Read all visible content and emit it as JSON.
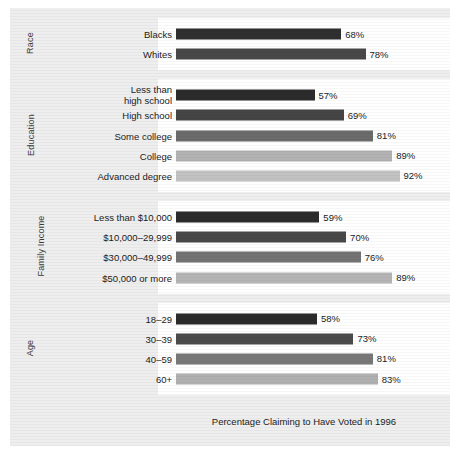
{
  "caption": "Percentage Claiming to Have Voted in 1996",
  "value_suffix": "%",
  "colors": {
    "frame_background": "#eeeeee",
    "panel_background": "#ffffff",
    "text": "#1c1c1c",
    "group_label_text": "#3b3b3b",
    "bar_shades": [
      "#2b2b2b",
      "#3f3f3f",
      "#555555",
      "#6e6e6e",
      "#8a8a8a",
      "#a6a6a6",
      "#bdbdbd",
      "#cccccc"
    ]
  },
  "chart_data": {
    "type": "bar",
    "orientation": "horizontal",
    "title": "",
    "xlabel": "Percentage Claiming to Have Voted in 1996",
    "ylabel": "",
    "xlim": [
      0,
      100
    ],
    "grid": false,
    "legend": "none",
    "value_format": "{v}%",
    "groups": [
      {
        "name": "Race",
        "categories": [
          "Blacks",
          "Whites"
        ],
        "values": [
          68,
          78
        ],
        "value_labels": [
          "68%",
          "78%"
        ],
        "bar_colors": [
          "#2f2f2f",
          "#484848"
        ]
      },
      {
        "name": "Education",
        "categories": [
          "Less than high school",
          "High school",
          "Some college",
          "College",
          "Advanced degree"
        ],
        "values": [
          57,
          69,
          81,
          89,
          92
        ],
        "value_labels": [
          "57%",
          "69%",
          "81%",
          "89%",
          "92%"
        ],
        "bar_colors": [
          "#2b2b2b",
          "#454545",
          "#6b6b6b",
          "#b2b2b2",
          "#c2c2c2"
        ]
      },
      {
        "name": "Family Income",
        "categories": [
          "Less than $10,000",
          "$10,000–29,999",
          "$30,000–49,999",
          "$50,000 or more"
        ],
        "values": [
          59,
          70,
          76,
          89
        ],
        "value_labels": [
          "59%",
          "70%",
          "76%",
          "89%"
        ],
        "bar_colors": [
          "#2b2b2b",
          "#484848",
          "#737373",
          "#b4b4b4"
        ]
      },
      {
        "name": "Age",
        "categories": [
          "18–29",
          "30–39",
          "40–59",
          "60+"
        ],
        "values": [
          58,
          73,
          81,
          83
        ],
        "value_labels": [
          "58%",
          "73%",
          "81%",
          "83%"
        ],
        "bar_colors": [
          "#2b2b2b",
          "#4b4b4b",
          "#787878",
          "#b0b0b0"
        ]
      }
    ]
  }
}
